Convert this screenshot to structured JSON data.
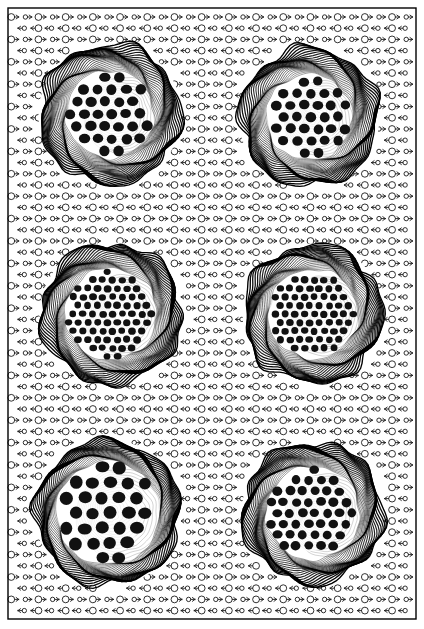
{
  "figure": {
    "title": "Vector field with six circular contour structures",
    "type": "scientific-visualization",
    "width": 424,
    "height": 629,
    "background_color": "#ffffff",
    "ink_color": "#000000"
  },
  "frame": {
    "name": "plot-border",
    "x": 8,
    "y": 8,
    "width": 408,
    "height": 611,
    "stroke_color": "#000000",
    "stroke_width": 1.4
  },
  "vector_field": {
    "description": "Regular lattice of arrow glyphs: open circle with a shaft and arrowhead, alternating direction by row",
    "glyph_name": "circle-arrow-glyph",
    "col_spacing": 13.6,
    "row_spacing": 11.2,
    "origin_x": 15,
    "origin_y": 17,
    "columns": 30,
    "rows": 55,
    "directions": [
      "right",
      "left"
    ],
    "circle_radius_large": 3.4,
    "circle_radius_small": 2.2,
    "shaft_length": 7.5,
    "stroke_width": 0.9,
    "stroke_color": "#1a1a1a"
  },
  "structures": {
    "count": 6,
    "layout": "2 columns x 3 rows",
    "common": {
      "ring_count": 26,
      "ring_stroke_width": 0.85,
      "ring_color": "#000000",
      "rim_band_color": "#000000",
      "core_fill": "#ffffff"
    },
    "items": [
      {
        "name": "structure-top-left",
        "row": 1,
        "column": 1,
        "center_x": 110,
        "center_y": 114,
        "outer_radius": 70,
        "core_radius": 44,
        "dot_radius": 5.2,
        "dot_count": 62,
        "ring_density": "high",
        "rim_dot_rings": 2
      },
      {
        "name": "structure-top-right",
        "row": 1,
        "column": 2,
        "center_x": 309,
        "center_y": 117,
        "outer_radius": 69,
        "core_radius": 43,
        "dot_radius": 5.0,
        "dot_count": 60,
        "ring_density": "high",
        "rim_dot_rings": 2
      },
      {
        "name": "structure-middle-left",
        "row": 2,
        "column": 1,
        "center_x": 111,
        "center_y": 314,
        "outer_radius": 70,
        "core_radius": 46,
        "dot_radius": 3.6,
        "dot_count": 56,
        "ring_density": "very-high",
        "rim_dot_rings": 2
      },
      {
        "name": "structure-middle-right",
        "row": 2,
        "column": 2,
        "center_x": 313,
        "center_y": 314,
        "outer_radius": 69,
        "core_radius": 45,
        "dot_radius": 3.6,
        "dot_count": 54,
        "ring_density": "very-high",
        "rim_dot_rings": 2
      },
      {
        "name": "structure-bottom-left",
        "row": 3,
        "column": 1,
        "center_x": 108,
        "center_y": 513,
        "outer_radius": 72,
        "core_radius": 52,
        "dot_radius": 6.4,
        "dot_count": 72,
        "ring_density": "high",
        "rim_dot_rings": 2
      },
      {
        "name": "structure-bottom-right",
        "row": 3,
        "column": 2,
        "center_x": 313,
        "center_y": 513,
        "outer_radius": 70,
        "core_radius": 47,
        "dot_radius": 4.6,
        "dot_count": 64,
        "ring_density": "high",
        "rim_dot_rings": 2
      }
    ]
  }
}
